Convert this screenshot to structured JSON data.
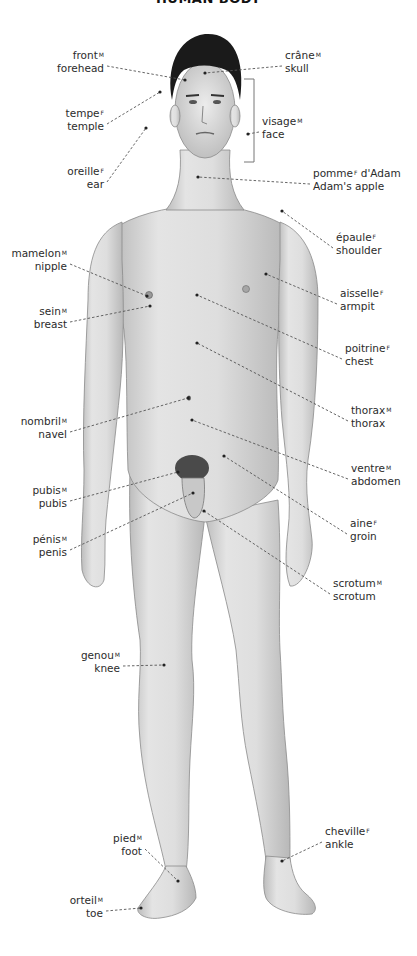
{
  "title": "HUMAN BODY",
  "figure": {
    "skin_color": "#dcdcdc",
    "hair_color": "#1a1a1a",
    "leader_color": "#555555"
  },
  "labels": [
    {
      "id": "front",
      "fr": "front",
      "gender": "M",
      "en": "forehead",
      "side": "left",
      "x": 104,
      "y": 62,
      "px": 185,
      "py": 80
    },
    {
      "id": "tempe",
      "fr": "tempe",
      "gender": "F",
      "en": "temple",
      "side": "left",
      "x": 104,
      "y": 120,
      "px": 160,
      "py": 92
    },
    {
      "id": "oreille",
      "fr": "oreille",
      "gender": "F",
      "en": "ear",
      "side": "left",
      "x": 104,
      "y": 178,
      "px": 146,
      "py": 128
    },
    {
      "id": "mamelon",
      "fr": "mamelon",
      "gender": "M",
      "en": "nipple",
      "side": "left",
      "x": 67,
      "y": 260,
      "px": 147,
      "py": 296
    },
    {
      "id": "sein",
      "fr": "sein",
      "gender": "M",
      "en": "breast",
      "side": "left",
      "x": 67,
      "y": 318,
      "px": 150,
      "py": 306
    },
    {
      "id": "nombril",
      "fr": "nombril",
      "gender": "M",
      "en": "navel",
      "side": "left",
      "x": 67,
      "y": 428,
      "px": 188,
      "py": 398
    },
    {
      "id": "pubis",
      "fr": "pubis",
      "gender": "M",
      "en": "pubis",
      "side": "left",
      "x": 67,
      "y": 497,
      "px": 178,
      "py": 472
    },
    {
      "id": "penis",
      "fr": "pénis",
      "gender": "M",
      "en": "penis",
      "side": "left",
      "x": 67,
      "y": 546,
      "px": 193,
      "py": 493
    },
    {
      "id": "genou",
      "fr": "genou",
      "gender": "M",
      "en": "knee",
      "side": "left",
      "x": 120,
      "y": 662,
      "px": 164,
      "py": 665
    },
    {
      "id": "pied",
      "fr": "pied",
      "gender": "M",
      "en": "foot",
      "side": "left",
      "x": 142,
      "y": 845,
      "px": 178,
      "py": 881
    },
    {
      "id": "orteil",
      "fr": "orteil",
      "gender": "M",
      "en": "toe",
      "side": "left",
      "x": 103,
      "y": 907,
      "px": 141,
      "py": 908
    },
    {
      "id": "crane",
      "fr": "crâne",
      "gender": "M",
      "en": "skull",
      "side": "right",
      "x": 285,
      "y": 62,
      "px": 205,
      "py": 73
    },
    {
      "id": "visage",
      "fr": "visage",
      "gender": "M",
      "en": "face",
      "side": "right",
      "x": 262,
      "y": 128,
      "px": 248,
      "py": 134
    },
    {
      "id": "pomme",
      "fr": "pomme",
      "gender": "F",
      "fr_suffix": " d'Adam",
      "en": "Adam's apple",
      "side": "right",
      "x": 313,
      "y": 180,
      "px": 198,
      "py": 177
    },
    {
      "id": "epaule",
      "fr": "épaule",
      "gender": "F",
      "en": "shoulder",
      "side": "right",
      "x": 336,
      "y": 244,
      "px": 282,
      "py": 211
    },
    {
      "id": "aisselle",
      "fr": "aisselle",
      "gender": "F",
      "en": "armpit",
      "side": "right",
      "x": 340,
      "y": 300,
      "px": 266,
      "py": 274
    },
    {
      "id": "poitrine",
      "fr": "poitrine",
      "gender": "F",
      "en": "chest",
      "side": "right",
      "x": 345,
      "y": 355,
      "px": 197,
      "py": 295
    },
    {
      "id": "thorax",
      "fr": "thorax",
      "gender": "M",
      "en": "thorax",
      "side": "right",
      "x": 351,
      "y": 417,
      "px": 197,
      "py": 343
    },
    {
      "id": "ventre",
      "fr": "ventre",
      "gender": "M",
      "en": "abdomen",
      "side": "right",
      "x": 351,
      "y": 475,
      "px": 192,
      "py": 420
    },
    {
      "id": "aine",
      "fr": "aine",
      "gender": "F",
      "en": "groin",
      "side": "right",
      "x": 350,
      "y": 530,
      "px": 224,
      "py": 456
    },
    {
      "id": "scrotum",
      "fr": "scrotum",
      "gender": "M",
      "en": "scrotum",
      "side": "right",
      "x": 333,
      "y": 590,
      "px": 204,
      "py": 511
    },
    {
      "id": "cheville",
      "fr": "cheville",
      "gender": "F",
      "en": "ankle",
      "side": "right",
      "x": 325,
      "y": 838,
      "px": 282,
      "py": 861
    }
  ],
  "face_bracket": {
    "x": 254,
    "y1": 79,
    "y2": 162
  }
}
